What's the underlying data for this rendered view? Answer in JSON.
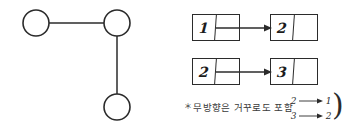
{
  "figure": {
    "background_color": "#ffffff",
    "ink_color": "#2b2b2b"
  },
  "graph": {
    "title": "undirected-graph-sketch",
    "type": "undirected",
    "nodes": [
      {
        "id": "n1",
        "label": "",
        "cx": 36,
        "cy": 23,
        "r": 13
      },
      {
        "id": "n2",
        "label": "",
        "cx": 117,
        "cy": 23,
        "r": 13
      },
      {
        "id": "n3",
        "label": "",
        "cx": 117,
        "cy": 107,
        "r": 13
      }
    ],
    "edges": [
      {
        "from": "n1",
        "to": "n2",
        "orientation": "horizontal"
      },
      {
        "from": "n2",
        "to": "n3",
        "orientation": "vertical"
      }
    ]
  },
  "adjacency_list": {
    "rows": [
      {
        "source": {
          "value": "1",
          "pointer": ""
        },
        "arrow": "arrow-right",
        "target": {
          "value": "2",
          "pointer": ""
        }
      },
      {
        "source": {
          "value": "2",
          "pointer": ""
        },
        "arrow": "arrow-right",
        "target": {
          "value": "3",
          "pointer": ""
        }
      }
    ]
  },
  "footnote": {
    "marker": "＊",
    "text": "무방향은 거꾸로도 포함",
    "reverse_edges": [
      {
        "from": "2",
        "to": "1"
      },
      {
        "from": "3",
        "to": "2"
      }
    ],
    "brace": ")"
  }
}
